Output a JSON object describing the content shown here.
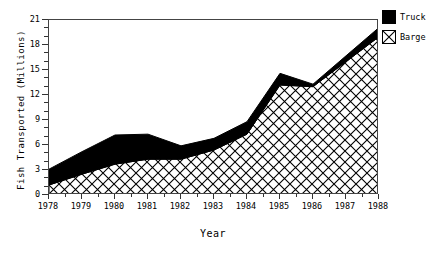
{
  "chart_data": {
    "type": "area",
    "title": "",
    "xlabel": "Year",
    "ylabel": "Fish Transported (Millions)",
    "categories": [
      "1978",
      "1979",
      "1980",
      "1981",
      "1982",
      "1983",
      "1984",
      "1985",
      "1986",
      "1987",
      "1988"
    ],
    "x": [
      1978,
      1979,
      1980,
      1981,
      1982,
      1983,
      1984,
      1985,
      1986,
      1987,
      1988
    ],
    "xlim": [
      1978,
      1988
    ],
    "ylim": [
      0,
      21
    ],
    "yticks": [
      0,
      3,
      6,
      9,
      12,
      15,
      18,
      21
    ],
    "ytick_labels": [
      "0",
      "3",
      "6",
      "9",
      "12",
      "15",
      "18",
      "21"
    ],
    "xtick_labels": [
      "1978",
      "1979",
      "1980",
      "1981",
      "1982",
      "1983",
      "1984",
      "1985",
      "1986",
      "1987",
      "1988"
    ],
    "grid": false,
    "stacked": true,
    "legend_position": "top-right",
    "series": [
      {
        "name": "Barge",
        "fill": "crosshatch",
        "color": "#000000",
        "values": [
          1.2,
          2.5,
          3.7,
          4.3,
          4.3,
          5.4,
          7.3,
          13.2,
          13.0,
          16.0,
          19.0
        ]
      },
      {
        "name": "Truck",
        "fill": "solid",
        "color": "#000000",
        "values": [
          1.9,
          2.7,
          3.5,
          3.0,
          1.6,
          1.4,
          1.5,
          1.4,
          0.3,
          0.7,
          1.1
        ]
      }
    ],
    "cumulative_top": [
      3.1,
      5.2,
      7.2,
      7.3,
      5.9,
      6.8,
      8.8,
      14.6,
      13.3,
      16.7,
      20.1
    ]
  },
  "legend": {
    "items": [
      {
        "label": "Truck",
        "swatch": "solid-black"
      },
      {
        "label": "Barge",
        "swatch": "crosshatch"
      }
    ]
  }
}
